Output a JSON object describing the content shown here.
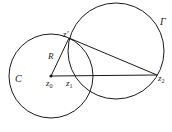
{
  "diagram": {
    "type": "geometry",
    "colors": {
      "stroke": "#1a1a1a",
      "text": "#222222",
      "background": "#ffffff"
    },
    "circles": [
      {
        "id": "C",
        "label": "C",
        "cx": 51,
        "cy": 76,
        "r": 42
      },
      {
        "id": "Gamma",
        "label": "Γ",
        "cx": 116,
        "cy": 51,
        "r": 48
      }
    ],
    "points": [
      {
        "id": "z0",
        "label": "z",
        "sub": "0",
        "x": 51,
        "y": 76
      },
      {
        "id": "z1",
        "label": "z",
        "sub": "1",
        "x": 68,
        "y": 76
      },
      {
        "id": "z2",
        "label": "z",
        "sub": "2",
        "x": 157,
        "y": 75
      },
      {
        "id": "zprime",
        "label": "z′",
        "x": 69,
        "y": 38
      }
    ],
    "segments": [
      {
        "from": "z0",
        "to": "zprime",
        "label": "R"
      },
      {
        "from": "z0",
        "to": "z2"
      },
      {
        "from": "zprime",
        "to": "z2"
      }
    ],
    "labels": {
      "C": "C",
      "Gamma": "Γ",
      "R": "R",
      "zprime": "z′",
      "z0_base": "z",
      "z0_sub": "0",
      "z1_base": "z",
      "z1_sub": "1",
      "z2_base": "z",
      "z2_sub": "2"
    }
  }
}
